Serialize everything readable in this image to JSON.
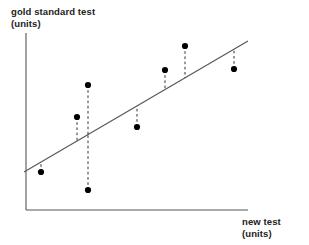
{
  "chart_data": {
    "type": "scatter",
    "title": "",
    "xlabel": "new test",
    "xlabel_units": "(units)",
    "ylabel": "gold standard test",
    "ylabel_units": "(units)",
    "grid": false,
    "legend": "none",
    "axis_ticks": false,
    "x": [
      41,
      77,
      88,
      88,
      137,
      165,
      185,
      234
    ],
    "y": [
      172,
      117,
      85,
      190,
      127,
      70,
      46,
      69
    ],
    "points": [
      {
        "x": 41,
        "y": 172,
        "fit_y": 162,
        "residual": -10,
        "side": "below-line"
      },
      {
        "x": 77,
        "y": 117,
        "fit_y": 141,
        "residual": 24,
        "side": "above-line"
      },
      {
        "x": 88,
        "y": 85,
        "fit_y": 135,
        "residual": 50,
        "side": "above-line"
      },
      {
        "x": 88,
        "y": 190,
        "fit_y": 135,
        "residual": -55,
        "side": "below-line"
      },
      {
        "x": 137,
        "y": 127,
        "fit_y": 106,
        "residual": -21,
        "side": "below-line"
      },
      {
        "x": 165,
        "y": 70,
        "fit_y": 90,
        "residual": 20,
        "side": "above-line"
      },
      {
        "x": 185,
        "y": 46,
        "fit_y": 78,
        "residual": 32,
        "side": "above-line"
      },
      {
        "x": 234,
        "y": 69,
        "fit_y": 49,
        "residual": -20,
        "side": "below-line"
      }
    ],
    "regression_line": {
      "x1": 24,
      "y1": 172,
      "x2": 248,
      "y2": 41,
      "style": "solid",
      "description": "best-fit line of agreement"
    },
    "residual_style": "dashed",
    "axes": {
      "y_axis": {
        "x": 26,
        "y_top": 33,
        "y_bottom": 210
      },
      "x_axis": {
        "y": 210,
        "x_left": 26,
        "x_right": 248
      }
    },
    "colors": {
      "point": "#000000",
      "line": "#555555",
      "axis": "#555555",
      "residual": "#333333",
      "text": "#222222",
      "background": "#ffffff"
    }
  }
}
